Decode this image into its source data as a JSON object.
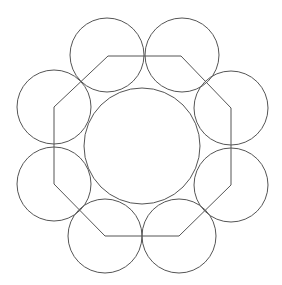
{
  "diagram": {
    "title": "",
    "width": 282,
    "height": 285,
    "background": "#ffffff",
    "stroke_color": "#555555",
    "center": [
      142,
      146
    ],
    "octagon": {
      "points": [
        [
          108,
          56
        ],
        [
          181,
          56
        ],
        [
          231,
          108
        ],
        [
          231,
          185
        ],
        [
          179,
          236
        ],
        [
          105,
          236
        ],
        [
          54,
          184
        ],
        [
          54,
          107
        ]
      ]
    },
    "central_circle": {
      "cx": 142,
      "cy": 146,
      "r": 58
    },
    "outer_circles": [
      {
        "cx": 107,
        "cy": 55,
        "r": 37
      },
      {
        "cx": 182,
        "cy": 55,
        "r": 37
      },
      {
        "cx": 231,
        "cy": 108,
        "r": 37
      },
      {
        "cx": 231,
        "cy": 185,
        "r": 37
      },
      {
        "cx": 179,
        "cy": 236,
        "r": 37
      },
      {
        "cx": 105,
        "cy": 236,
        "r": 37
      },
      {
        "cx": 54,
        "cy": 184,
        "r": 37
      },
      {
        "cx": 54,
        "cy": 107,
        "r": 37
      }
    ]
  }
}
